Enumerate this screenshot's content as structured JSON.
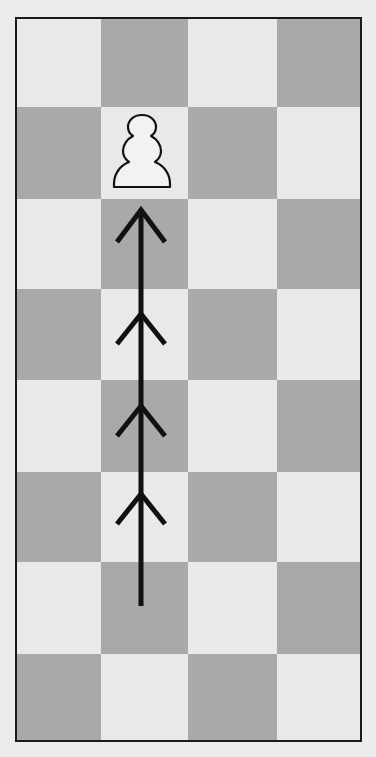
{
  "diagram": {
    "type": "chess-board-fragment",
    "columns": 4,
    "rows": 8,
    "colors": {
      "light_square": "#e9e9e9",
      "dark_square": "#a9a9a9",
      "border": "#1a1a1a",
      "arrow": "#111111",
      "piece_fill": "#f2f2f2",
      "piece_outline": "#111111"
    },
    "pattern": [
      [
        "light",
        "dark",
        "light",
        "dark"
      ],
      [
        "dark",
        "light",
        "dark",
        "light"
      ],
      [
        "light",
        "dark",
        "light",
        "dark"
      ],
      [
        "dark",
        "light",
        "dark",
        "light"
      ],
      [
        "light",
        "dark",
        "light",
        "dark"
      ],
      [
        "dark",
        "light",
        "dark",
        "light"
      ],
      [
        "light",
        "dark",
        "light",
        "dark"
      ],
      [
        "dark",
        "light",
        "dark",
        "light"
      ]
    ],
    "pieces": [
      {
        "type": "pawn",
        "color": "white",
        "row": 2,
        "column": 2,
        "icon": "white-pawn-icon"
      }
    ],
    "arrow": {
      "column": 2,
      "from_row": 7,
      "to_row": 3,
      "direction": "up",
      "chevron_count": 4
    }
  }
}
